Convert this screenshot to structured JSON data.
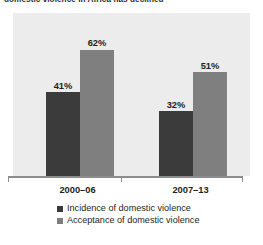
{
  "title": {
    "text": "domestic violence in Africa has declined",
    "cropped": true
  },
  "chart_data": {
    "type": "bar",
    "title": "domestic violence in Africa has declined",
    "xlabel": "",
    "ylabel": "",
    "ylim": [
      0,
      80
    ],
    "grid": false,
    "legend_position": "bottom",
    "categories": [
      "2000–06",
      "2007–13"
    ],
    "series": [
      {
        "name": "Incidence of domestic violence",
        "color": "#3b3b3b",
        "values": [
          41,
          32
        ],
        "labels": [
          "41%",
          "32%"
        ]
      },
      {
        "name": "Acceptance of domestic violence",
        "color": "#7f7f7f",
        "values": [
          62,
          51
        ],
        "labels": [
          "62%",
          "51%"
        ]
      }
    ]
  },
  "axis": {
    "tick_labels": [
      "2000–06",
      "2007–13"
    ]
  },
  "legend": {
    "items": [
      {
        "label": "Incidence of domestic violence",
        "color": "#3b3b3b"
      },
      {
        "label": "Acceptance of domestic violence",
        "color": "#7f7f7f"
      }
    ]
  },
  "colors": {
    "panel_background": "#ececec",
    "page_background": "#ffffff",
    "axis": "#8d8d8d",
    "text": "#231f20"
  }
}
